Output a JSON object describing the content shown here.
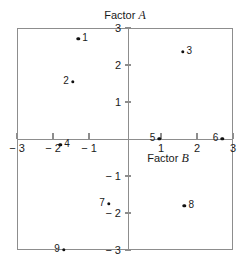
{
  "chart_data": {
    "type": "scatter",
    "title": "",
    "xlabel": "Factor B",
    "ylabel": "Factor A",
    "xlim": [
      -3,
      3
    ],
    "ylim": [
      -3,
      3
    ],
    "grid": false,
    "legend": false,
    "xticks": [
      -3,
      -2,
      -1,
      1,
      2,
      3
    ],
    "yticks": [
      -3,
      -2,
      -1,
      1,
      2,
      3
    ],
    "xtick_labels": [
      "− 3",
      "− 2",
      "− 1",
      "1",
      "2",
      "3"
    ],
    "ytick_labels": [
      "− 3",
      "− 2",
      "− 1",
      "1",
      "2",
      "3"
    ],
    "point_label_field": "label",
    "points": [
      {
        "label": "1",
        "x": -1.3,
        "y": 2.7,
        "label_side": "right"
      },
      {
        "label": "2",
        "x": -1.45,
        "y": 1.55,
        "label_side": "left"
      },
      {
        "label": "3",
        "x": 1.6,
        "y": 2.35,
        "label_side": "right"
      },
      {
        "label": "4",
        "x": -1.8,
        "y": -0.15,
        "label_side": "right"
      },
      {
        "label": "5",
        "x": 0.95,
        "y": 0.0,
        "label_side": "left"
      },
      {
        "label": "6",
        "x": 2.7,
        "y": 0.0,
        "label_side": "left"
      },
      {
        "label": "7",
        "x": -0.45,
        "y": -1.75,
        "label_side": "left"
      },
      {
        "label": "8",
        "x": 1.65,
        "y": -1.8,
        "label_side": "right"
      },
      {
        "label": "9",
        "x": -1.7,
        "y": -3.0,
        "label_side": "left"
      }
    ]
  },
  "axes": {
    "x_title_text": "Factor ",
    "x_title_symbol": "B",
    "y_title_text": "Factor ",
    "y_title_symbol": "A"
  },
  "colors": {
    "axis": "#8d8d8d",
    "point": "#111111",
    "text": "#1a1a1a",
    "background": "#ffffff"
  }
}
